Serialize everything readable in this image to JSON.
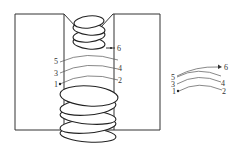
{
  "diagram": {
    "type": "weld-bead-sequence",
    "main_view": {
      "labels": [
        {
          "id": "1",
          "text": "1"
        },
        {
          "id": "2",
          "text": "2"
        },
        {
          "id": "3",
          "text": "3"
        },
        {
          "id": "4",
          "text": "4"
        },
        {
          "id": "5",
          "text": "5"
        },
        {
          "id": "6",
          "text": "6"
        }
      ]
    },
    "path_inset": {
      "labels": [
        {
          "id": "1",
          "text": "1"
        },
        {
          "id": "2",
          "text": "2"
        },
        {
          "id": "3",
          "text": "3"
        },
        {
          "id": "4",
          "text": "4"
        },
        {
          "id": "5",
          "text": "5"
        },
        {
          "id": "6",
          "text": "6"
        }
      ]
    },
    "colors": {
      "line": "#333333",
      "background": "#ffffff"
    }
  }
}
